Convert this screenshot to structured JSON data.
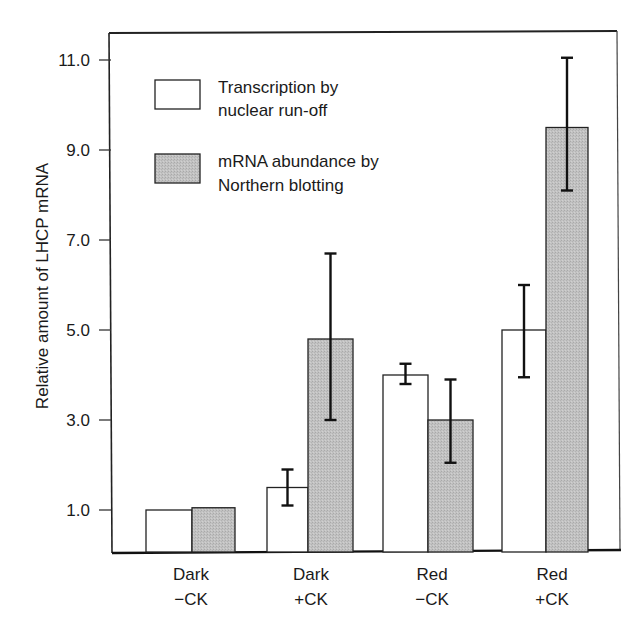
{
  "chart_data": {
    "type": "bar",
    "title": "",
    "xlabel": "",
    "ylabel": "Relative amount of LHCP mRNA",
    "ylim": [
      0,
      11.5
    ],
    "yticks": [
      1.0,
      3.0,
      5.0,
      7.0,
      9.0,
      11.0
    ],
    "ytick_labels": [
      "1.0",
      "3.0",
      "5.0",
      "7.0",
      "9.0",
      "11.0"
    ],
    "grid": false,
    "legend_position": "upper left (inside plot)",
    "categories": [
      {
        "line1": "Dark",
        "line2": "−CK"
      },
      {
        "line1": "Dark",
        "line2": "+CK"
      },
      {
        "line1": "Red",
        "line2": "−CK"
      },
      {
        "line1": "Red",
        "line2": "+CK"
      }
    ],
    "series": [
      {
        "name": "Transcription by nuclear run-off",
        "legend_lines": [
          "Transcription by",
          "nuclear run-off"
        ],
        "color": "#ffffff",
        "values": [
          1.0,
          1.5,
          4.0,
          5.0
        ],
        "error_low": [
          null,
          1.1,
          3.8,
          3.95
        ],
        "error_high": [
          null,
          1.9,
          4.25,
          6.0
        ]
      },
      {
        "name": "mRNA abundance by Northern blotting",
        "legend_lines": [
          "mRNA abundance by",
          "Northern blotting"
        ],
        "color": "#bdbdbd",
        "values": [
          1.05,
          4.8,
          3.0,
          9.5
        ],
        "error_low": [
          null,
          3.0,
          2.05,
          8.1
        ],
        "error_high": [
          null,
          6.7,
          3.9,
          11.05
        ]
      }
    ]
  }
}
